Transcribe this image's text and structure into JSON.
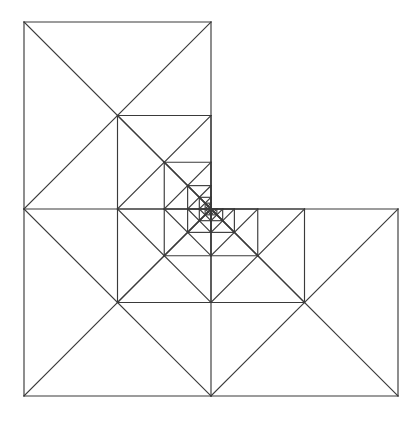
{
  "figure": {
    "title": "Recursive L-tromino dissection",
    "type": "geometric-line-drawing",
    "canvas": {
      "width": 415,
      "height": 429,
      "background": "#ffffff"
    },
    "stroke": {
      "color": "#3a3a3a",
      "width": 1.15
    },
    "geometry": {
      "outer_bounds": {
        "x_min": 24,
        "y_min": 22,
        "x_max": 398,
        "y_max": 404
      },
      "seed_square_size": 187,
      "recursion_levels": 6,
      "scale_factor": 0.5,
      "l_orientation": "missing-quadrant-top-right",
      "outer_outline_points": "24,22 211,22 211,213 398,213 398,404 24,404",
      "level_corners": [
        {
          "level": 1,
          "x": 24,
          "y": 22,
          "size": 187
        },
        {
          "level": 2,
          "x": 117.5,
          "y": 117.5,
          "size": 93.5
        },
        {
          "level": 3,
          "x": 164.25,
          "y": 165.25,
          "size": 46.75
        },
        {
          "level": 4,
          "x": 187.625,
          "y": 189.125,
          "size": 23.375
        },
        {
          "level": 5,
          "x": 199.3125,
          "y": 201.0625,
          "size": 11.6875
        },
        {
          "level": 6,
          "x": 205.15625,
          "y": 207.03125,
          "size": 5.84375
        }
      ]
    },
    "chart_data": {
      "type": "line-figure",
      "title": "Recursive L-tromino dissection",
      "series": [
        {
          "name": "outer-outline",
          "closed": true,
          "points": [
            [
              24,
              22
            ],
            [
              211,
              22
            ],
            [
              211,
              213
            ],
            [
              398,
              213
            ],
            [
              398,
              404
            ],
            [
              24,
              404
            ]
          ]
        },
        {
          "name": "level-1-square-top-left",
          "bbox": [
            24,
            22,
            211,
            213
          ],
          "diagonals": "both"
        },
        {
          "name": "level-1-square-bottom-left",
          "bbox": [
            24,
            213,
            211,
            404
          ],
          "diagonals": "both"
        },
        {
          "name": "level-1-square-bottom-right",
          "bbox": [
            211,
            213,
            398,
            404
          ],
          "diagonals": "both"
        },
        {
          "name": "level-2-square-top-left",
          "bbox": [
            117.5,
            117.5,
            211,
            213
          ],
          "diagonals": "both"
        },
        {
          "name": "level-3-square-top-left",
          "bbox": [
            164.25,
            165.25,
            211,
            213
          ],
          "diagonals": "both"
        },
        {
          "name": "level-4-square-top-left",
          "bbox": [
            187.6,
            189.1,
            211,
            213
          ],
          "diagonals": "both"
        },
        {
          "name": "level-5-square-top-left",
          "bbox": [
            199.3,
            201.1,
            211,
            213
          ],
          "diagonals": "both"
        },
        {
          "name": "level-6-square-top-left",
          "bbox": [
            205.2,
            207.0,
            211,
            213
          ],
          "diagonals": "both"
        }
      ],
      "xlabel": "",
      "ylabel": "",
      "grid": false,
      "legend": "none"
    }
  }
}
